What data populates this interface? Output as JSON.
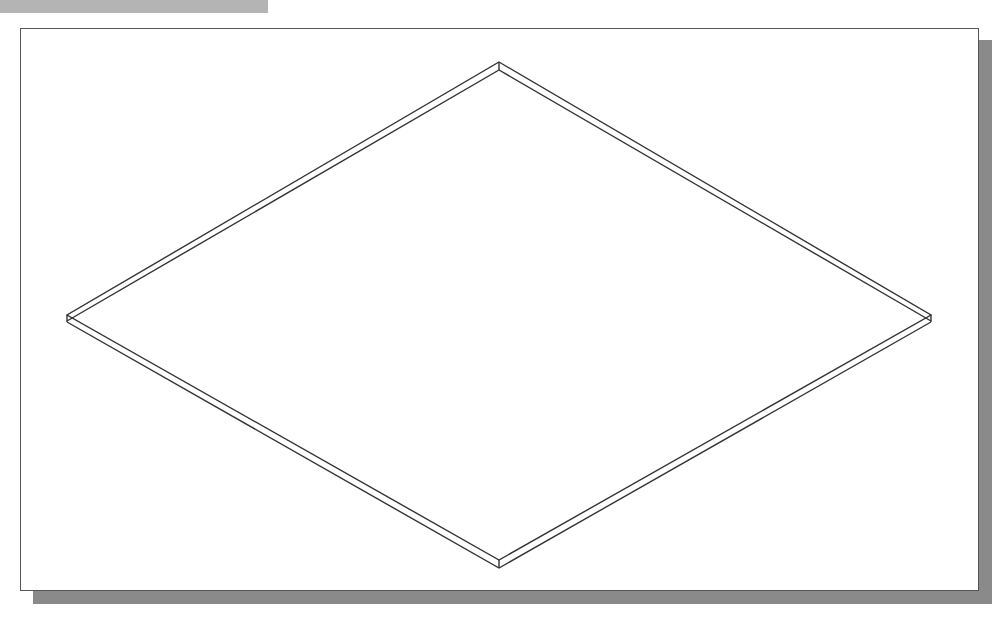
{
  "figure": {
    "colors": {
      "background": "#ffffff",
      "frame_border": "#555555",
      "shadow": "#8a8a8a",
      "top_bar": "#b4b4b4",
      "line": "#333333"
    },
    "shape": {
      "top_face": [
        [
          499,
          62
        ],
        [
          931,
          315
        ],
        [
          499,
          560
        ],
        [
          67,
          315
        ]
      ],
      "thickness_px": 8
    }
  }
}
